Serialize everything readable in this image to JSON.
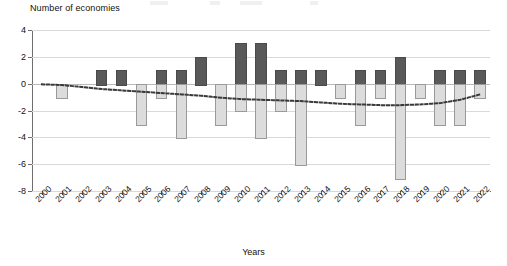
{
  "axes": {
    "y_title": "Number of economies",
    "x_title": "Years",
    "y_ticks": [
      "4",
      "2",
      "0",
      "-2",
      "-4",
      "-6",
      "-8"
    ]
  },
  "chart_data": {
    "type": "bar",
    "title": "",
    "subtitle": "",
    "xlabel": "Years",
    "ylabel": "Number of economies",
    "ylim": [
      -8,
      4
    ],
    "ytick_values": [
      4,
      2,
      0,
      -2,
      -4,
      -6,
      -8
    ],
    "grid": true,
    "legend_position": "top (cropped)",
    "stacked": false,
    "orientation": "vertical",
    "categories": [
      "2000",
      "2001",
      "2002",
      "2003",
      "2004",
      "2005",
      "2006",
      "2007",
      "2008",
      "2009",
      "2010",
      "2011",
      "2012",
      "2013",
      "2014",
      "2015",
      "2016",
      "2017",
      "2018",
      "2019",
      "2020",
      "2021",
      "2022"
    ],
    "series": [
      {
        "name": "Upgrades",
        "color": "#595959",
        "values": [
          0,
          0,
          0,
          1,
          1,
          0,
          1,
          1,
          2,
          0,
          3,
          3,
          1,
          1,
          1,
          0,
          1,
          1,
          2,
          0,
          1,
          1,
          1
        ]
      },
      {
        "name": "Downgrades",
        "color": "#dcdcdc",
        "values": [
          0,
          -1,
          0,
          0,
          0,
          -3,
          -1,
          -4,
          0,
          -3,
          -2,
          -4,
          -2,
          -6,
          0,
          -1,
          -3,
          -1,
          -7,
          -1,
          -3,
          -3,
          -1
        ]
      }
    ],
    "trend_line": {
      "name": "Trend",
      "style": "dotted",
      "color": "#3a3a3a",
      "values": [
        -0.05,
        -0.1,
        -0.25,
        -0.4,
        -0.5,
        -0.6,
        -0.7,
        -0.8,
        -0.9,
        -1.05,
        -1.15,
        -1.2,
        -1.25,
        -1.3,
        -1.4,
        -1.5,
        -1.55,
        -1.6,
        -1.6,
        -1.55,
        -1.45,
        -1.2,
        -0.8
      ]
    }
  }
}
